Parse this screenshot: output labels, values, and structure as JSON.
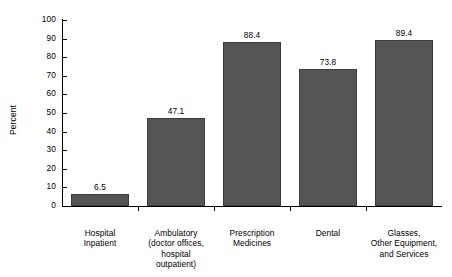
{
  "chart_data": {
    "type": "bar",
    "title": "",
    "xlabel": "",
    "ylabel": "Percent",
    "ylim": [
      0,
      100
    ],
    "ytick_step": 10,
    "ytick_labels": [
      "0",
      "10",
      "20",
      "30",
      "40",
      "50",
      "60",
      "70",
      "80",
      "90",
      "100"
    ],
    "grid": false,
    "legend": null,
    "bar_color": "#555555",
    "bar_edge_color": "#3d3d3d",
    "categories": [
      "Hospital\nInpatient",
      "Ambulatory\n(doctor offices,\nhospital\noutpatient)",
      "Prescription\nMedicines",
      "Dental",
      "Glasses,\nOther Equipment,\nand Services"
    ],
    "values": [
      6.5,
      47.1,
      88.4,
      73.8,
      89.4
    ],
    "value_labels": [
      "6.5",
      "47.1",
      "88.4",
      "73.8",
      "89.4"
    ]
  },
  "axis": {
    "y_title": "Percent"
  }
}
